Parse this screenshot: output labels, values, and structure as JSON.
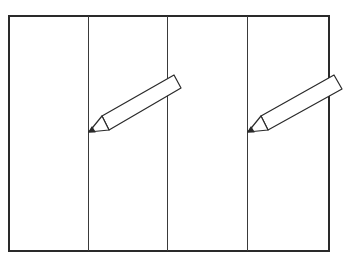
{
  "diagram": {
    "panel_count": 4,
    "pencil_count": 2,
    "stroke_color": "#2a2a2a",
    "background_color": "#ffffff",
    "icons": [
      "pencil-icon",
      "pencil-icon"
    ]
  }
}
